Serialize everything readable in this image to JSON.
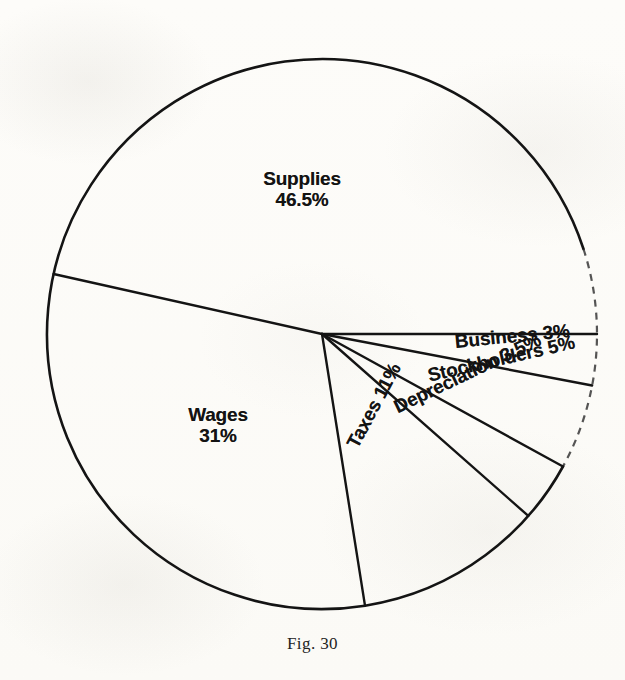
{
  "figure": {
    "caption": "Fig. 30",
    "background_color": "#fdfcf9",
    "line_color": "#141414"
  },
  "labels": {
    "supplies": {
      "name": "Supplies",
      "percent": "46.5%"
    },
    "wages": {
      "name": "Wages",
      "percent": "31%"
    },
    "taxes": {
      "name": "Taxes 11%"
    },
    "depreciation": {
      "name": "Depreciation 3.5%"
    },
    "stockholders": {
      "name": "Stockholders 5%"
    },
    "business": {
      "name": "Business 3%"
    }
  },
  "chart_data": {
    "type": "pie",
    "title": "Fig. 30",
    "subtitle": "",
    "xlabel": "",
    "ylabel": "",
    "legend": "none",
    "grid": false,
    "labels_inline": true,
    "units": "percent",
    "total": 100,
    "start_angle_deg": 0,
    "direction": "clockwise",
    "center_px": [
      322,
      334
    ],
    "radius_px": 275,
    "categories": [
      "Business",
      "Stockholders",
      "Depreciation",
      "Taxes",
      "Wages",
      "Supplies"
    ],
    "values": [
      3,
      5,
      3.5,
      11,
      31,
      46.5
    ],
    "slices": [
      {
        "label": "Business",
        "value": 3,
        "value_text": "3%",
        "start_deg": 0,
        "end_deg": 10.8,
        "label_rotation_deg": -5.5
      },
      {
        "label": "Stockholders",
        "value": 5,
        "value_text": "5%",
        "start_deg": 10.8,
        "end_deg": 28.8,
        "label_rotation_deg": -13
      },
      {
        "label": "Depreciation",
        "value": 3.5,
        "value_text": "3.5%",
        "start_deg": 28.8,
        "end_deg": 41.4,
        "label_rotation_deg": -25.5
      },
      {
        "label": "Taxes",
        "value": 11,
        "value_text": "11%",
        "start_deg": 41.4,
        "end_deg": 81.0,
        "label_rotation_deg": -62
      },
      {
        "label": "Wages",
        "value": 31,
        "value_text": "31%",
        "start_deg": 81.0,
        "end_deg": 192.6,
        "label_rotation_deg": 0
      },
      {
        "label": "Supplies",
        "value": 46.5,
        "value_text": "46.5%",
        "start_deg": 192.6,
        "end_deg": 360,
        "label_rotation_deg": 0
      }
    ]
  }
}
